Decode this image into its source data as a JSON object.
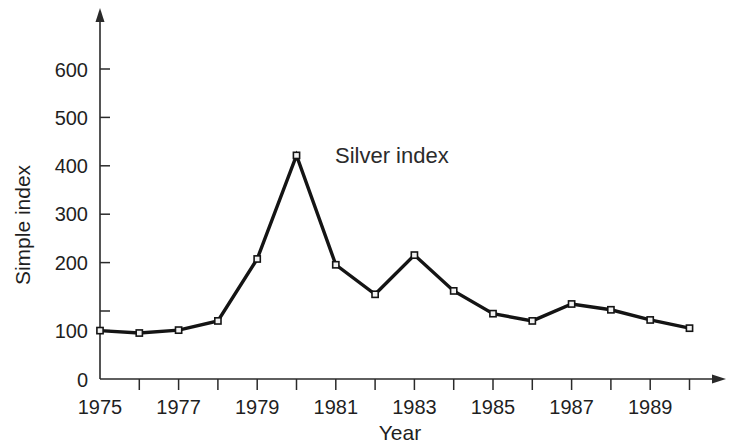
{
  "chart_data": {
    "type": "line",
    "title": "",
    "xlabel": "Year",
    "ylabel": "Simple index",
    "annotation": "Silver index",
    "series_name": "Silver index",
    "x": [
      1975,
      1976,
      1977,
      1978,
      1979,
      1980,
      1981,
      1982,
      1983,
      1984,
      1985,
      1986,
      1987,
      1988,
      1989,
      1990
    ],
    "values": [
      100,
      95,
      101,
      120,
      248,
      462,
      236,
      175,
      256,
      182,
      135,
      120,
      155,
      143,
      122,
      105
    ],
    "series": [
      {
        "name": "Silver index",
        "values": [
          100,
          95,
          101,
          120,
          248,
          462,
          236,
          175,
          256,
          182,
          135,
          120,
          155,
          143,
          122,
          105
        ]
      }
    ],
    "xlim": [
      1975,
      1990
    ],
    "ylim": [
      0,
      680
    ],
    "y_ticks": [
      0,
      100,
      200,
      300,
      400,
      500,
      600
    ],
    "y_tick_labels": [
      "0",
      "100",
      "200",
      "300",
      "400",
      "500",
      "600"
    ],
    "x_ticks": [
      1975,
      1976,
      1977,
      1978,
      1979,
      1980,
      1981,
      1982,
      1983,
      1984,
      1985,
      1986,
      1987,
      1988,
      1989,
      1990
    ],
    "x_tick_labels": [
      "1975",
      "",
      "1977",
      "",
      "1979",
      "",
      "1981",
      "",
      "1983",
      "",
      "1985",
      "",
      "1987",
      "",
      "1989",
      ""
    ],
    "x_labeled_years": [
      "1975",
      "1977",
      "1979",
      "1981",
      "1983",
      "1985",
      "1987",
      "1989"
    ],
    "grid": false,
    "legend": "none",
    "marker": "square",
    "line_color": "#141414",
    "marker_fill": "#f2f2f2",
    "axis_color": "#2a2a2a",
    "background": "#ffffff"
  },
  "axes": {
    "y_title": "Simple index",
    "x_title": "Year",
    "y_labels": {
      "t0": "0",
      "t100": "100",
      "t200": "200",
      "t300": "300",
      "t400": "400",
      "t500": "500",
      "t600": "600"
    },
    "x_labels": {
      "y1975": "1975",
      "y1977": "1977",
      "y1979": "1979",
      "y1981": "1981",
      "y1983": "1983",
      "y1985": "1985",
      "y1987": "1987",
      "y1989": "1989"
    }
  },
  "annotations": {
    "series_label": "Silver index"
  }
}
